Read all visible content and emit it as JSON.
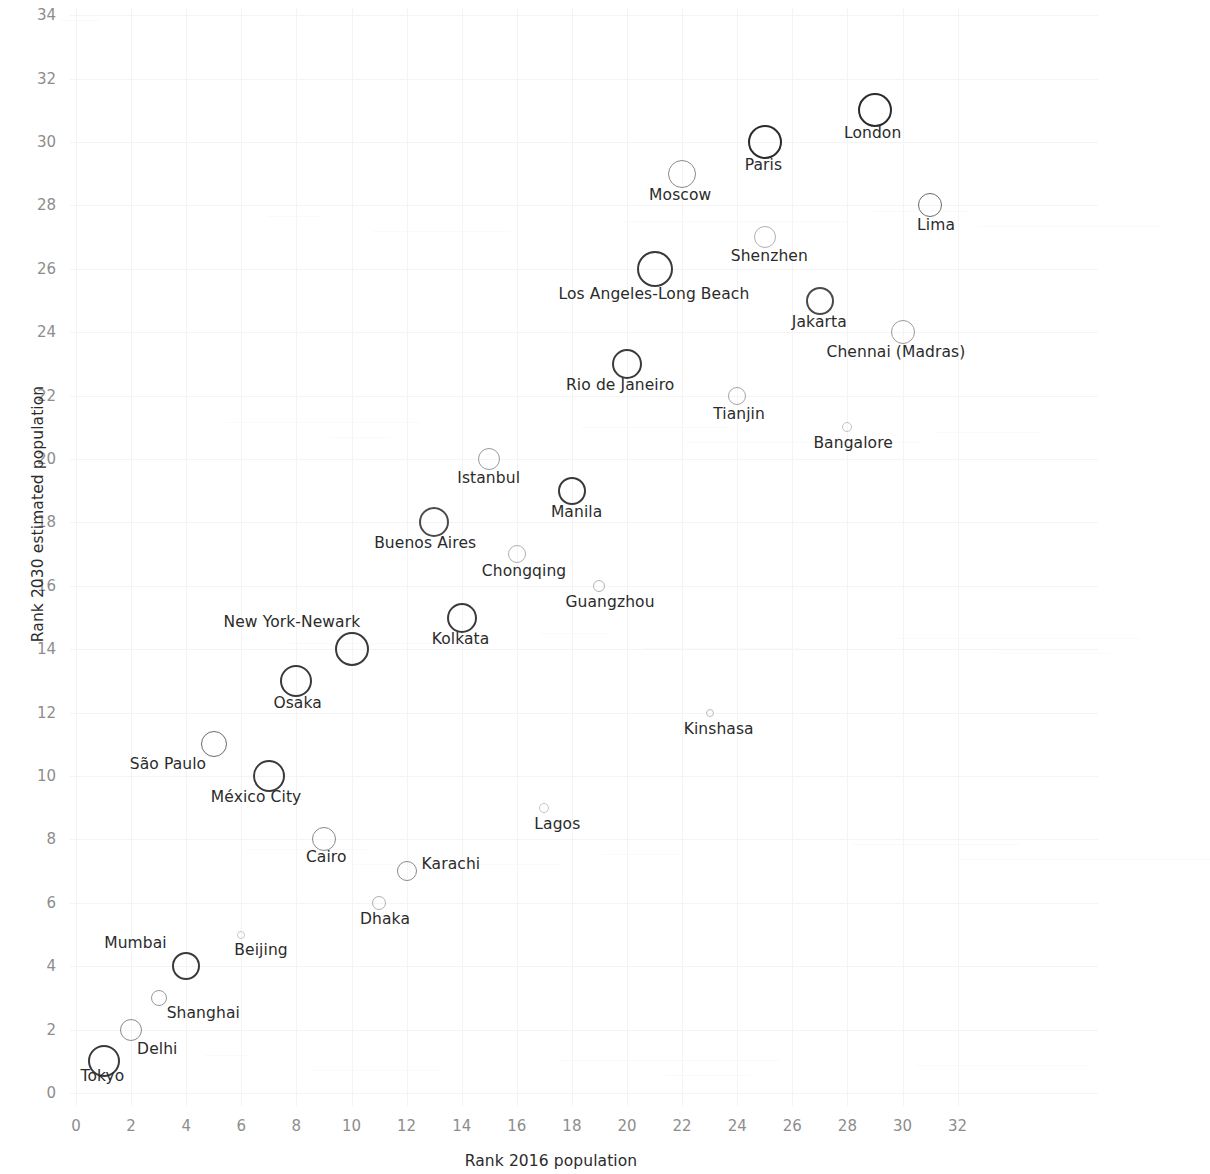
{
  "chart_data": {
    "type": "scatter",
    "title": "",
    "xlabel": "Rank  2016 population",
    "ylabel": "Rank 2030 estimated population",
    "xlim": [
      0,
      32
    ],
    "ylim": [
      0,
      34
    ],
    "xticks": [
      0,
      2,
      4,
      6,
      8,
      10,
      12,
      14,
      16,
      18,
      20,
      22,
      24,
      26,
      28,
      30,
      32
    ],
    "yticks": [
      0,
      2,
      4,
      6,
      8,
      10,
      12,
      14,
      16,
      18,
      20,
      22,
      24,
      26,
      28,
      30,
      32,
      34
    ],
    "grid": true,
    "legend": "none",
    "marker": "open-circle",
    "size_encoding": "bubble radius varies by city (population magnitude)",
    "points": [
      {
        "label": "Tokyo",
        "x": 1,
        "y": 1,
        "r": 16,
        "label_dx": -23,
        "label_dy": 16,
        "stroke": "#3a3a3a",
        "weight": 2.4
      },
      {
        "label": "Delhi",
        "x": 2,
        "y": 2,
        "r": 11,
        "label_dx": 6,
        "label_dy": 20,
        "stroke": "#8a8a8a",
        "weight": 1.6
      },
      {
        "label": "Shanghai",
        "x": 3,
        "y": 3,
        "r": 8,
        "label_dx": 8,
        "label_dy": 16,
        "stroke": "#9a9a9a",
        "weight": 1.5
      },
      {
        "label": "Mumbai",
        "x": 4,
        "y": 4,
        "r": 14,
        "label_dx": -82,
        "label_dy": -22,
        "stroke": "#3a3a3a",
        "weight": 2.1
      },
      {
        "label": "Beijing",
        "x": 6,
        "y": 5,
        "r": 4,
        "label_dx": -7,
        "label_dy": 16,
        "stroke": "#c9c9c9",
        "weight": 1.2
      },
      {
        "label": "Dhaka",
        "x": 11,
        "y": 6,
        "r": 7,
        "label_dx": -19,
        "label_dy": 17,
        "stroke": "#b0b0b0",
        "weight": 1.4
      },
      {
        "label": "Karachi",
        "x": 12,
        "y": 7,
        "r": 10,
        "label_dx": 15,
        "label_dy": -6,
        "stroke": "#8a8a8a",
        "weight": 1.7
      },
      {
        "label": "Cairo",
        "x": 9,
        "y": 8,
        "r": 12,
        "label_dx": -18,
        "label_dy": 19,
        "stroke": "#8a8a8a",
        "weight": 1.7
      },
      {
        "label": "Lagos",
        "x": 17,
        "y": 9,
        "r": 5,
        "label_dx": -10,
        "label_dy": 17,
        "stroke": "#c4c4c4",
        "weight": 1.2
      },
      {
        "label": "México City",
        "x": 7,
        "y": 10,
        "r": 16,
        "label_dx": -58,
        "label_dy": 22,
        "stroke": "#3a3a3a",
        "weight": 2.4
      },
      {
        "label": "São Paulo",
        "x": 5,
        "y": 11,
        "r": 13,
        "label_dx": -84,
        "label_dy": 21,
        "stroke": "#6a6a6a",
        "weight": 1.9
      },
      {
        "label": "Kinshasa",
        "x": 23,
        "y": 12,
        "r": 4,
        "label_dx": -26,
        "label_dy": 17,
        "stroke": "#bdbdbd",
        "weight": 1.2
      },
      {
        "label": "Osaka",
        "x": 8,
        "y": 13,
        "r": 16,
        "label_dx": -23,
        "label_dy": 23,
        "stroke": "#3a3a3a",
        "weight": 2.4
      },
      {
        "label": "New York-Newark",
        "x": 10,
        "y": 14,
        "r": 17,
        "label_dx": -128,
        "label_dy": -26,
        "stroke": "#3a3a3a",
        "weight": 2.4
      },
      {
        "label": "Kolkata",
        "x": 14,
        "y": 15,
        "r": 15,
        "label_dx": -30,
        "label_dy": 22,
        "stroke": "#3a3a3a",
        "weight": 2.2
      },
      {
        "label": "Guangzhou",
        "x": 19,
        "y": 16,
        "r": 6,
        "label_dx": -34,
        "label_dy": 17,
        "stroke": "#b5b5b5",
        "weight": 1.3
      },
      {
        "label": "Chongqing",
        "x": 16,
        "y": 17,
        "r": 9,
        "label_dx": -35,
        "label_dy": 18,
        "stroke": "#b0b0b0",
        "weight": 1.5
      },
      {
        "label": "Buenos Aires",
        "x": 13,
        "y": 18,
        "r": 15,
        "label_dx": -60,
        "label_dy": 22,
        "stroke": "#4a4a4a",
        "weight": 2.2
      },
      {
        "label": "Manila",
        "x": 18,
        "y": 19,
        "r": 14,
        "label_dx": -21,
        "label_dy": 22,
        "stroke": "#3a3a3a",
        "weight": 2.1
      },
      {
        "label": "Istanbul",
        "x": 15,
        "y": 20,
        "r": 11,
        "label_dx": -32,
        "label_dy": 20,
        "stroke": "#9a9a9a",
        "weight": 1.6
      },
      {
        "label": "Bangalore",
        "x": 28,
        "y": 21,
        "r": 5,
        "label_dx": -34,
        "label_dy": 17,
        "stroke": "#c4c4c4",
        "weight": 1.2
      },
      {
        "label": "Tianjin",
        "x": 24,
        "y": 22,
        "r": 9,
        "label_dx": -24,
        "label_dy": 19,
        "stroke": "#a6a6a6",
        "weight": 1.5
      },
      {
        "label": "Rio de Janeiro",
        "x": 20,
        "y": 23,
        "r": 15,
        "label_dx": -61,
        "label_dy": 22,
        "stroke": "#3a3a3a",
        "weight": 2.2
      },
      {
        "label": "Chennai (Madras)",
        "x": 30,
        "y": 24,
        "r": 12,
        "label_dx": -76,
        "label_dy": 21,
        "stroke": "#9a9a9a",
        "weight": 1.7
      },
      {
        "label": "Jakarta",
        "x": 27,
        "y": 25,
        "r": 14,
        "label_dx": -28,
        "label_dy": 22,
        "stroke": "#4a4a4a",
        "weight": 2.1
      },
      {
        "label": "Los Angeles-Long Beach",
        "x": 21,
        "y": 26,
        "r": 18,
        "label_dx": -96,
        "label_dy": 26,
        "stroke": "#3a3a3a",
        "weight": 2.5
      },
      {
        "label": "Shenzhen",
        "x": 25,
        "y": 27,
        "r": 11,
        "label_dx": -34,
        "label_dy": 20,
        "stroke": "#b0b0b0",
        "weight": 1.5
      },
      {
        "label": "Lima",
        "x": 31,
        "y": 28,
        "r": 12,
        "label_dx": -13,
        "label_dy": 21,
        "stroke": "#6a6a6a",
        "weight": 1.8
      },
      {
        "label": "Moscow",
        "x": 22,
        "y": 29,
        "r": 14,
        "label_dx": -33,
        "label_dy": 22,
        "stroke": "#8a8a8a",
        "weight": 1.8
      },
      {
        "label": "Paris",
        "x": 25,
        "y": 30,
        "r": 17,
        "label_dx": -20,
        "label_dy": 24,
        "stroke": "#2b2b2b",
        "weight": 2.6
      },
      {
        "label": "London",
        "x": 29,
        "y": 31,
        "r": 17,
        "label_dx": -31,
        "label_dy": 24,
        "stroke": "#2b2b2b",
        "weight": 2.6
      }
    ]
  }
}
